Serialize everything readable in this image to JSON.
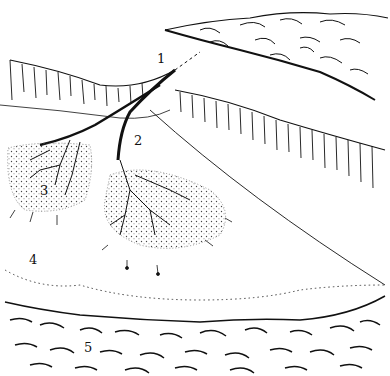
{
  "diagram": {
    "type": "illustration",
    "labels": [
      {
        "id": "1",
        "text": "1",
        "x": 157,
        "y": 52
      },
      {
        "id": "2",
        "text": "2",
        "x": 134,
        "y": 134
      },
      {
        "id": "3",
        "text": "3",
        "x": 40,
        "y": 184
      },
      {
        "id": "4",
        "text": "4",
        "x": 29,
        "y": 253
      },
      {
        "id": "5",
        "text": "5",
        "x": 84,
        "y": 341
      }
    ],
    "colors": {
      "ink": "#111111",
      "paper": "#ffffff",
      "stipple": "#555555"
    }
  }
}
